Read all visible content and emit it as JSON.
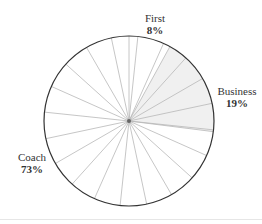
{
  "chart_data": {
    "type": "pie",
    "title": "",
    "categories": [
      "First",
      "Business",
      "Coach"
    ],
    "values": [
      8,
      19,
      73
    ],
    "labels": [
      {
        "name": "First",
        "pct": "8%"
      },
      {
        "name": "Business",
        "pct": "19%"
      },
      {
        "name": "Coach",
        "pct": "73%"
      }
    ],
    "highlighted": "Business",
    "colors": {
      "outline": "#333333",
      "spoke": "#b8b8b8",
      "highlight_fill": "#f0f0f0",
      "background": "#ffffff"
    },
    "decorative_spokes": {
      "count": 20,
      "start_deg": 6,
      "step_deg": 18
    }
  }
}
